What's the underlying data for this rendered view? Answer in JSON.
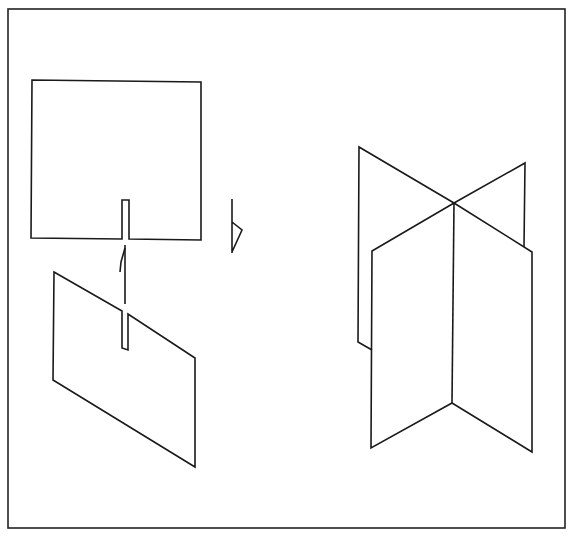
{
  "figure": {
    "colors": {
      "line": "#1a1a1a",
      "background": "#ffffff",
      "frame": "#222222"
    },
    "parts": [
      {
        "name": "top-slotted-card",
        "view": "front"
      },
      {
        "name": "assembly-arrow",
        "direction": "up"
      },
      {
        "name": "bottom-slotted-card",
        "view": "oblique"
      },
      {
        "name": "edge-view-card",
        "view": "side"
      },
      {
        "name": "assembled-cross",
        "view": "oblique"
      }
    ]
  }
}
